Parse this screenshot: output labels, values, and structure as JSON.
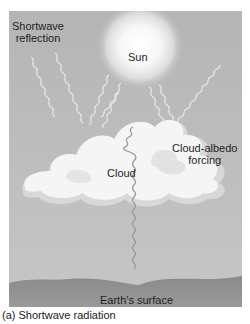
{
  "diagram": {
    "labels": {
      "shortwave_reflection_line1": "Shortwave",
      "shortwave_reflection_line2": "reflection",
      "sun": "Sun",
      "cloud_albedo_line1": "Cloud-albedo",
      "cloud_albedo_line2": "forcing",
      "cloud": "Cloud",
      "earth_surface": "Earth's surface"
    },
    "caption": "(a)  Shortwave radiation",
    "colors": {
      "background": "#b9b9b9",
      "sun_core": "#ffffff",
      "cloud": "#f4f4f4",
      "cloud_shadow": "#d6d6d6",
      "ground": "#8e8e8e",
      "rays": "#e6e6e6"
    }
  }
}
